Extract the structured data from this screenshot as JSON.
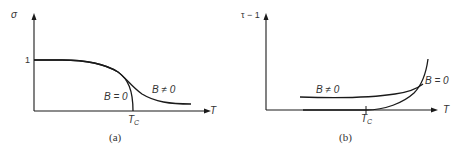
{
  "panels": [
    {
      "id": "a",
      "caption": "(a)",
      "y_axis_label": "σ",
      "x_axis_label": "T",
      "y_tick_label": "1",
      "critical_label_main": "T",
      "critical_label_sub": "C",
      "curves": [
        {
          "name": "B = 0",
          "label": "B = 0",
          "description": "order parameter drops to zero at critical temperature"
        },
        {
          "name": "B ≠ 0",
          "label": "B ≠ 0",
          "description": "smooth decay extending past critical temperature"
        }
      ]
    },
    {
      "id": "b",
      "caption": "(b)",
      "y_axis_label": "τ − 1",
      "x_axis_label": "T",
      "critical_label_main": "T",
      "critical_label_sub": "C",
      "curves": [
        {
          "name": "B ≠ 0",
          "label": "B ≠ 0",
          "description": "nonzero baseline rising gradually"
        },
        {
          "name": "B = 0",
          "label": "B = 0",
          "description": "zero below critical temperature, rising above"
        }
      ]
    }
  ]
}
